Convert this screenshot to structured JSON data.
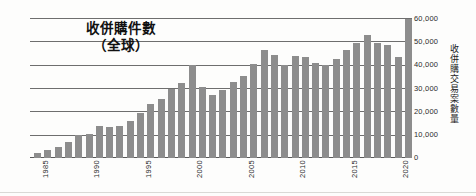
{
  "title": {
    "line1": "收併購件數",
    "line2": "（全球）"
  },
  "axes": {
    "y_label": "收併購交易案數量",
    "y_ticks": [
      "60,000",
      "50,000",
      "40,000",
      "30,000",
      "20,000",
      "10,000",
      "0"
    ],
    "x_ticks": [
      "1985",
      "1990",
      "1995",
      "2000",
      "2005",
      "2010",
      "2015",
      "2020"
    ]
  },
  "colors": {
    "bar": "#8d8d8d",
    "gridline": "#6e6e6e",
    "text": "#2b2b2b",
    "background": "#fdfdfc"
  },
  "chart_data": {
    "type": "bar",
    "xlabel": "",
    "ylabel": "收併購交易案數量",
    "ylim": [
      0,
      60000
    ],
    "ytick_values": [
      0,
      10000,
      20000,
      30000,
      40000,
      50000,
      60000
    ],
    "grid": true,
    "legend": "none",
    "categories": [
      "1985",
      "1986",
      "1987",
      "1988",
      "1989",
      "1990",
      "1991",
      "1992",
      "1993",
      "1994",
      "1995",
      "1996",
      "1997",
      "1998",
      "1999",
      "2000",
      "2001",
      "2002",
      "2003",
      "2004",
      "2005",
      "2006",
      "2007",
      "2008",
      "2009",
      "2010",
      "2011",
      "2012",
      "2013",
      "2014",
      "2015",
      "2016",
      "2017",
      "2018",
      "2019",
      "2020",
      "2021"
    ],
    "values": [
      2200,
      3500,
      4700,
      6800,
      9800,
      10200,
      13800,
      13200,
      13800,
      15800,
      19500,
      23200,
      25600,
      29600,
      32300,
      40000,
      30600,
      27000,
      29200,
      32800,
      35200,
      40700,
      46800,
      44500,
      40200,
      44200,
      43400,
      41000,
      40200,
      42600,
      46700,
      49800,
      53000,
      49700,
      48700,
      43400,
      60000
    ],
    "value_unit": "deals"
  }
}
